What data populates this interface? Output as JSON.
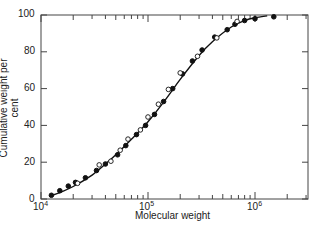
{
  "chart_data": {
    "type": "scatter",
    "title": "",
    "xlabel": "Molecular weight",
    "ylabel": "Cumulative weight per cent",
    "xscale": "log",
    "xlim": [
      10000,
      2000000
    ],
    "ylim": [
      0,
      100
    ],
    "x_ticks": [
      "10^4",
      "10^5",
      "10^6"
    ],
    "y_ticks": [
      0,
      20,
      40,
      60,
      80,
      100
    ],
    "grid": false,
    "legend": null,
    "series": [
      {
        "name": "filled circles",
        "marker": "filled",
        "points": [
          [
            12500,
            2
          ],
          [
            15000,
            4.5
          ],
          [
            18000,
            7
          ],
          [
            21000,
            9
          ],
          [
            26000,
            11.5
          ],
          [
            33000,
            15.5
          ],
          [
            40000,
            19
          ],
          [
            52000,
            24
          ],
          [
            62000,
            29
          ],
          [
            78000,
            35
          ],
          [
            95000,
            40
          ],
          [
            115000,
            46
          ],
          [
            140000,
            53
          ],
          [
            170000,
            60
          ],
          [
            210000,
            68
          ],
          [
            260000,
            75
          ],
          [
            320000,
            81
          ],
          [
            420000,
            88
          ],
          [
            550000,
            92
          ],
          [
            650000,
            95
          ],
          [
            800000,
            97
          ],
          [
            1000000,
            98
          ],
          [
            1500000,
            99
          ]
        ]
      },
      {
        "name": "open circles",
        "marker": "open",
        "points": [
          [
            22000,
            8
          ],
          [
            35000,
            18
          ],
          [
            45000,
            20
          ],
          [
            55000,
            26
          ],
          [
            65000,
            32
          ],
          [
            85000,
            37
          ],
          [
            100000,
            44
          ],
          [
            125000,
            51
          ],
          [
            155000,
            59
          ],
          [
            200000,
            68
          ],
          [
            290000,
            77
          ],
          [
            440000,
            87
          ],
          [
            680000,
            96
          ]
        ]
      },
      {
        "name": "fitted curve",
        "marker": "line",
        "points": [
          [
            12000,
            1.5
          ],
          [
            15000,
            3.5
          ],
          [
            20000,
            6.8
          ],
          [
            30000,
            13
          ],
          [
            40000,
            19
          ],
          [
            50000,
            24
          ],
          [
            70000,
            32.5
          ],
          [
            100000,
            42
          ],
          [
            150000,
            55
          ],
          [
            200000,
            65
          ],
          [
            300000,
            78
          ],
          [
            400000,
            85.5
          ],
          [
            600000,
            93.5
          ],
          [
            800000,
            97
          ],
          [
            1000000,
            98.5
          ],
          [
            1300000,
            99.5
          ]
        ]
      }
    ]
  },
  "axes": {
    "x_label": "Molecular weight",
    "y_label": "Cumulative weight per cent",
    "y_tick_labels": [
      "0",
      "20",
      "40",
      "60",
      "80",
      "100"
    ],
    "x_tick_bases": [
      "10",
      "10",
      "10"
    ],
    "x_tick_exps": [
      "4",
      "5",
      "6"
    ]
  }
}
